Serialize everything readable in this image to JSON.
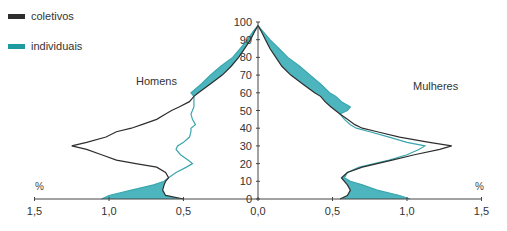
{
  "chart_data": {
    "type": "area",
    "subtype": "population-pyramid",
    "title": "",
    "xlabel": "%",
    "ylabel": "",
    "legend_position": "top-left",
    "legend": [
      {
        "name": "coletivos",
        "color": "#2e2e2e"
      },
      {
        "name": "individuais",
        "color": "#4db5be"
      }
    ],
    "sides": {
      "left": "Homens",
      "right": "Mulheres"
    },
    "xlim": [
      -1.5,
      1.5
    ],
    "x_ticks": [
      1.5,
      1.0,
      0.5,
      0.0,
      0.5,
      1.0,
      1.5
    ],
    "x_tick_labels": [
      "1,5",
      "1,0",
      "0,5",
      "0,0",
      "0,5",
      "1,0",
      "1,5"
    ],
    "ylim": [
      0,
      100
    ],
    "y_ticks": [
      0,
      10,
      20,
      30,
      40,
      50,
      60,
      70,
      80,
      90,
      100
    ],
    "y_tick_labels": [
      "0",
      "10",
      "20",
      "30",
      "40",
      "50",
      "60",
      "70",
      "80",
      "90",
      "100"
    ],
    "grid": false,
    "ages": [
      0,
      2,
      5,
      8,
      10,
      12,
      15,
      18,
      20,
      22,
      25,
      28,
      30,
      32,
      35,
      38,
      40,
      42,
      45,
      48,
      50,
      52,
      55,
      58,
      60,
      65,
      70,
      75,
      80,
      85,
      90,
      95,
      98
    ],
    "series": [
      {
        "name": "coletivos",
        "side": "Homens",
        "values": [
          0.5,
          0.62,
          0.64,
          0.63,
          0.62,
          0.6,
          0.62,
          0.68,
          0.82,
          0.95,
          1.05,
          1.15,
          1.25,
          1.15,
          1.02,
          0.95,
          0.85,
          0.78,
          0.68,
          0.62,
          0.58,
          0.53,
          0.46,
          0.43,
          0.4,
          0.32,
          0.24,
          0.18,
          0.13,
          0.09,
          0.05,
          0.02,
          0.0
        ]
      },
      {
        "name": "individuais",
        "side": "Homens",
        "values": [
          1.05,
          1.0,
          0.85,
          0.7,
          0.63,
          0.6,
          0.55,
          0.48,
          0.44,
          0.47,
          0.52,
          0.55,
          0.54,
          0.5,
          0.46,
          0.45,
          0.45,
          0.42,
          0.44,
          0.45,
          0.44,
          0.43,
          0.43,
          0.43,
          0.45,
          0.38,
          0.32,
          0.25,
          0.17,
          0.12,
          0.07,
          0.03,
          0.0
        ]
      },
      {
        "name": "coletivos",
        "side": "Mulheres",
        "values": [
          0.55,
          0.6,
          0.62,
          0.6,
          0.58,
          0.56,
          0.6,
          0.7,
          0.8,
          0.9,
          1.05,
          1.22,
          1.3,
          1.15,
          0.95,
          0.8,
          0.7,
          0.65,
          0.6,
          0.55,
          0.52,
          0.49,
          0.45,
          0.42,
          0.38,
          0.3,
          0.22,
          0.16,
          0.12,
          0.08,
          0.05,
          0.02,
          0.0
        ]
      },
      {
        "name": "individuais",
        "side": "Mulheres",
        "values": [
          1.02,
          0.95,
          0.8,
          0.7,
          0.62,
          0.58,
          0.6,
          0.68,
          0.78,
          0.88,
          1.0,
          1.08,
          1.12,
          1.0,
          0.88,
          0.75,
          0.66,
          0.62,
          0.58,
          0.55,
          0.6,
          0.62,
          0.56,
          0.52,
          0.48,
          0.42,
          0.35,
          0.28,
          0.2,
          0.14,
          0.08,
          0.03,
          0.0
        ]
      }
    ]
  },
  "legend": {
    "items": [
      {
        "label": "coletivos",
        "color": "#2e2e2e"
      },
      {
        "label": "individuais",
        "color": "#1f9a9f"
      }
    ]
  },
  "labels": {
    "left_side": "Homens",
    "right_side": "Mulheres",
    "unit_left": "%",
    "unit_right": "%"
  },
  "colors": {
    "fill": "#4db5be",
    "teal_line": "#3aa6ae",
    "black_line": "#2e2e2e",
    "axis": "#444444"
  }
}
